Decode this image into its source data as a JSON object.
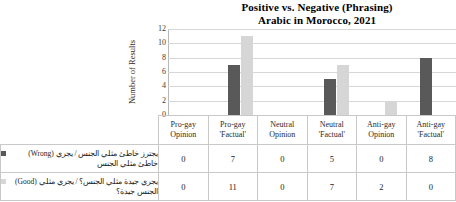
{
  "chart_data": {
    "type": "bar",
    "title": "Positive vs. Negative (Phrasing) Arabic in Morocco, 2021",
    "title_lines": [
      "Positive vs. Negative (Phrasing)",
      "Arabic in Morocco, 2021"
    ],
    "xlabel": "",
    "ylabel": "Number of Results",
    "ylim": [
      0,
      12
    ],
    "yticks": [
      12,
      10,
      8,
      6,
      4,
      2,
      0
    ],
    "grid": true,
    "legend_position": "data-table-left",
    "categories": [
      "Pro-gay Opinion",
      "Pro-gay 'Factual'",
      "Neutral Opinion",
      "Neutral 'Factual'",
      "Anti-gay Opinion",
      "Anti-gay 'Factual'"
    ],
    "category_lines": [
      [
        "Pro-gay",
        "Opinion"
      ],
      [
        "Pro-gay",
        "'Factual'"
      ],
      [
        "Neutral",
        "Opinion"
      ],
      [
        "Neutral",
        "'Factual'"
      ],
      [
        "Anti-gay",
        "Opinion"
      ],
      [
        "Anti-gay",
        "'Factual'"
      ]
    ],
    "series": [
      {
        "name": "(Wrong) يجري خاطئ مثلي الجنس / يجري خاطئ مثلي الجنس",
        "name_lines": [
          "يجترز خاطئ مثلي الجنس / يجري",
          "خاطئ مثلي الجنس"
        ],
        "label_en": "(Wrong)",
        "color": "#595959",
        "values": [
          0,
          7,
          0,
          5,
          0,
          8
        ]
      },
      {
        "name": "(Good) يجري جيدة مثلي الجنس؟ / يجري مثلي الجنس جيدة؟",
        "name_lines": [
          "يجري جيدة مثلي الجنس؟ / يجري مثلي",
          "الجنس جيدة؟"
        ],
        "label_en": "(Good)",
        "color": "#d6d6d6",
        "values": [
          0,
          11,
          0,
          7,
          2,
          0
        ]
      }
    ],
    "bars_drawn": [
      {
        "group": 1,
        "series": 0,
        "value": 7
      },
      {
        "group": 1,
        "series": 1,
        "value": 11
      },
      {
        "group": 3,
        "series": 0,
        "value": 5
      },
      {
        "group": 3,
        "series": 1,
        "value": 7
      },
      {
        "group": 4,
        "series": 1,
        "value": 2
      },
      {
        "group": 5,
        "series": 1,
        "value": 8
      }
    ]
  },
  "colors": {
    "series_wrong": "#595959",
    "series_good": "#d6d6d6",
    "grid": "#d7d7d7",
    "axis": "#b8b8b8",
    "table_border": "#c9c9c9",
    "background": "#ffffff"
  }
}
